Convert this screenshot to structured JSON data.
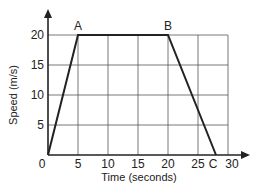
{
  "chart_data": {
    "type": "line",
    "title": "",
    "xlabel": "Time (seconds)",
    "ylabel": "Speed (m/s)",
    "x_ticks": [
      "0",
      "5",
      "10",
      "15",
      "20",
      "25",
      "30"
    ],
    "y_ticks": [
      "5",
      "10",
      "15",
      "20"
    ],
    "xlim": [
      0,
      30
    ],
    "ylim": [
      0,
      20
    ],
    "grid": true,
    "series": [
      {
        "name": "speed",
        "x": [
          0,
          5,
          20,
          28
        ],
        "y": [
          0,
          20,
          20,
          0
        ]
      }
    ],
    "annotations": [
      {
        "label": "A",
        "x": 5,
        "y": 20
      },
      {
        "label": "B",
        "x": 20,
        "y": 20
      },
      {
        "label": "C",
        "x": 28,
        "y": 0
      }
    ],
    "origin_label": "0"
  },
  "colors": {
    "line": "#222222",
    "grid": "#555555",
    "background": "#ffffff"
  }
}
